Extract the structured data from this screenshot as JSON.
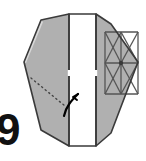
{
  "figure": {
    "kind": "origami-fold-diagram",
    "canvas": {
      "width": 146,
      "height": 161,
      "background": "#ffffff"
    }
  },
  "palette": {
    "paper_front": "#ffffff",
    "paper_back": "#b0b0b0",
    "paper_back_shaded": "#a8a8a8",
    "edge_line": "#3a3a3a",
    "crease_line": "#555555",
    "fold_dotted": "#444444",
    "arrow": "#000000",
    "step_number": "#111111"
  },
  "shapes": {
    "left_panel": {
      "name": "left-flap-panel",
      "fill": "#b0b0b0",
      "points": "69,14 69,146 41,130 24,62 41,20"
    },
    "left_panel_edge": {
      "name": "left-flap-edge-highlight",
      "fill": "#d8d8d8",
      "points": "24,62 41,20 43,22 26,63"
    },
    "center_strip": {
      "name": "center-white-strip",
      "fill": "#ffffff",
      "points": "69,14 96,14 96,146 69,146"
    },
    "right_panel": {
      "name": "right-grid-panel",
      "fill": "#b0b0b0",
      "points": "96,14 111,24 138,62 111,133 96,146"
    },
    "right_grid_rect": {
      "name": "right-crease-grid-rect",
      "x": 105,
      "y": 32,
      "width": 33,
      "height": 62
    }
  },
  "creases": {
    "dotted_fold": {
      "name": "dotted-fold-line",
      "label": "hidden fold line",
      "style": "dotted",
      "points": "31,78 65,106"
    },
    "grid_lines": [
      {
        "name": "grid-line-horizontal-top",
        "points": "105,32 138,32"
      },
      {
        "name": "grid-line-horizontal-middle",
        "points": "105,63 138,63"
      },
      {
        "name": "grid-line-horizontal-bottom",
        "points": "105,94 138,94"
      },
      {
        "name": "grid-line-vertical-left",
        "points": "105,32 105,94"
      },
      {
        "name": "grid-line-vertical-middle",
        "points": "121,32 121,94"
      },
      {
        "name": "grid-line-vertical-right",
        "points": "138,32 138,94"
      },
      {
        "name": "grid-diagonal-cell-tl-a",
        "points": "105,32 121,63"
      },
      {
        "name": "grid-diagonal-cell-tl-b",
        "points": "121,32 105,63"
      },
      {
        "name": "grid-diagonal-cell-tr-a",
        "points": "121,32 138,63"
      },
      {
        "name": "grid-diagonal-cell-tr-b",
        "points": "138,32 121,63"
      },
      {
        "name": "grid-diagonal-cell-bl-a",
        "points": "105,63 121,94"
      },
      {
        "name": "grid-diagonal-cell-bl-b",
        "points": "121,63 105,94"
      },
      {
        "name": "grid-diagonal-cell-br-a",
        "points": "121,63 138,94"
      },
      {
        "name": "grid-diagonal-cell-br-b",
        "points": "138,63 121,94"
      }
    ],
    "grid_center_dot": {
      "name": "grid-center-dot",
      "cx": 121,
      "cy": 63,
      "r": 2.2
    },
    "notch_left": {
      "name": "left-strip-notch",
      "points": "69,70 69,76"
    },
    "notch_right": {
      "name": "right-strip-notch",
      "points": "96,70 96,76"
    }
  },
  "arrow": {
    "name": "fold-direction-arrow",
    "label": "fold upward arrow",
    "path": "M 64,116 C 66,106 72,100 78,94",
    "head_points": "78,94 73,97 77,100",
    "color": "#000000"
  },
  "step_number": {
    "name": "step-number-glyph",
    "value": "9",
    "visible_portion": "partially cropped at left edge",
    "x": -4,
    "y": 145
  }
}
